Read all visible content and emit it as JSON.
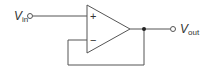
{
  "diagram": {
    "type": "op-amp voltage follower (unity-gain buffer)",
    "input": {
      "label": "V",
      "subscript": "in"
    },
    "output": {
      "label": "V",
      "subscript": "out"
    },
    "opamp": {
      "non_inverting_sign": "+",
      "inverting_sign": "−"
    },
    "stroke_color": "#555555"
  }
}
